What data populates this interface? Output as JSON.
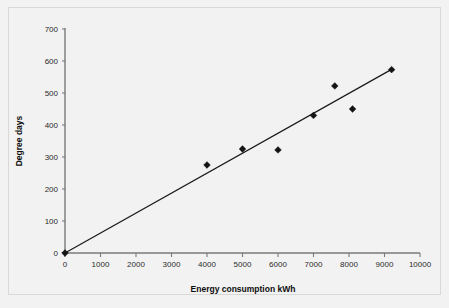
{
  "chart_data": {
    "type": "scatter",
    "title": "",
    "xlabel": "Energy consumption kWh",
    "ylabel": "Degree days",
    "xlim": [
      0,
      10000
    ],
    "ylim": [
      0,
      700
    ],
    "x_ticks": [
      "0",
      "1000",
      "2000",
      "3000",
      "4000",
      "5000",
      "6000",
      "7000",
      "8000",
      "9000",
      "10000"
    ],
    "y_ticks": [
      "0",
      "100",
      "200",
      "300",
      "400",
      "500",
      "600",
      "700"
    ],
    "x_tick_step": 1000,
    "y_tick_step": 100,
    "grid": false,
    "legend": false,
    "marker_shape": "diamond",
    "marker_color": "#141414",
    "trendline_color": "#1a1a1a",
    "axis_color": "#7a7a7a",
    "background_color": "#f2f2f2",
    "points": [
      {
        "x": 0,
        "y": 0
      },
      {
        "x": 4000,
        "y": 275
      },
      {
        "x": 5000,
        "y": 325
      },
      {
        "x": 6000,
        "y": 322
      },
      {
        "x": 7000,
        "y": 430
      },
      {
        "x": 7600,
        "y": 522
      },
      {
        "x": 8100,
        "y": 450
      },
      {
        "x": 9200,
        "y": 573
      }
    ],
    "trendline": {
      "name": "linear fit",
      "x_start": 0,
      "y_start": 0,
      "x_end": 9250,
      "y_end": 577
    }
  },
  "axes": {
    "x_title": "Energy consumption kWh",
    "y_title": "Degree days"
  }
}
